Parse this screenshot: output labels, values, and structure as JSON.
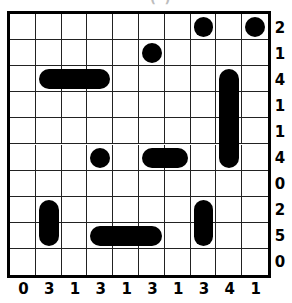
{
  "puzzle": {
    "type": "battleships",
    "title_fragment": "( )",
    "rows": 10,
    "cols": 10,
    "row_clues": [
      "2",
      "1",
      "4",
      "1",
      "1",
      "4",
      "0",
      "2",
      "5",
      "0"
    ],
    "col_clues": [
      "0",
      "3",
      "1",
      "3",
      "1",
      "3",
      "1",
      "3",
      "4",
      "1"
    ],
    "ships": [
      {
        "row": 0,
        "col": 7,
        "length": 1,
        "orientation": "h"
      },
      {
        "row": 0,
        "col": 9,
        "length": 1,
        "orientation": "h"
      },
      {
        "row": 1,
        "col": 5,
        "length": 1,
        "orientation": "h"
      },
      {
        "row": 2,
        "col": 1,
        "length": 3,
        "orientation": "h"
      },
      {
        "row": 2,
        "col": 8,
        "length": 4,
        "orientation": "v"
      },
      {
        "row": 5,
        "col": 3,
        "length": 1,
        "orientation": "h"
      },
      {
        "row": 5,
        "col": 5,
        "length": 2,
        "orientation": "h"
      },
      {
        "row": 7,
        "col": 1,
        "length": 2,
        "orientation": "v"
      },
      {
        "row": 7,
        "col": 7,
        "length": 2,
        "orientation": "v"
      },
      {
        "row": 8,
        "col": 3,
        "length": 3,
        "orientation": "h"
      }
    ],
    "colors": {
      "ship": "#000000",
      "grid_line": "#222222",
      "background": "#ffffff"
    }
  }
}
